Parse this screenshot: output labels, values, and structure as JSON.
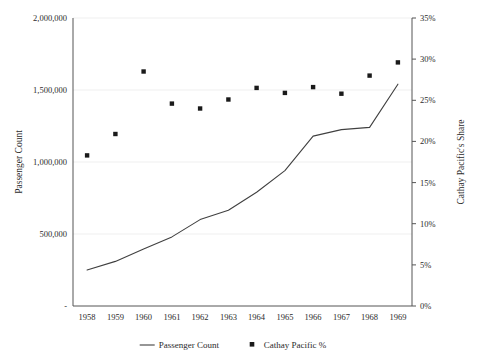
{
  "chart_data": {
    "type": "line",
    "title": "",
    "xlabel": "",
    "ylabel": "Passenger Count",
    "y2label": "Cathay Pacific's Share",
    "grid": true,
    "legend_position": "bottom",
    "categories": [
      "1958",
      "1959",
      "1960",
      "1961",
      "1962",
      "1963",
      "1964",
      "1965",
      "1966",
      "1967",
      "1968",
      "1969"
    ],
    "ylim": [
      0,
      2000000
    ],
    "y2lim": [
      0,
      0.35
    ],
    "yticks": [
      "-",
      "500,000",
      "1,000,000",
      "1,500,000",
      "2,000,000"
    ],
    "ytick_values": [
      0,
      500000,
      1000000,
      1500000,
      2000000
    ],
    "y2ticks": [
      "0%",
      "5%",
      "10%",
      "15%",
      "20%",
      "25%",
      "30%",
      "35%"
    ],
    "y2tick_values": [
      0,
      5,
      10,
      15,
      20,
      25,
      30,
      35
    ],
    "series": [
      {
        "name": "Passenger Count",
        "type": "line",
        "axis": "left",
        "color": "#404040",
        "values": [
          250000,
          310000,
          395000,
          480000,
          600000,
          665000,
          790000,
          940000,
          1180000,
          1225000,
          1240000,
          1540000
        ]
      },
      {
        "name": "Cathay Pacific %",
        "type": "scatter",
        "axis": "right",
        "color": "#1a1a1a",
        "marker": "square",
        "values": [
          18.3,
          20.9,
          28.5,
          24.6,
          24.0,
          25.1,
          26.5,
          25.9,
          26.6,
          25.8,
          28.0,
          29.6
        ]
      }
    ],
    "legend": [
      {
        "label": "Passenger Count",
        "marker": "line",
        "color": "#404040"
      },
      {
        "label": "Cathay Pacific %",
        "marker": "square",
        "color": "#1a1a1a"
      }
    ]
  }
}
